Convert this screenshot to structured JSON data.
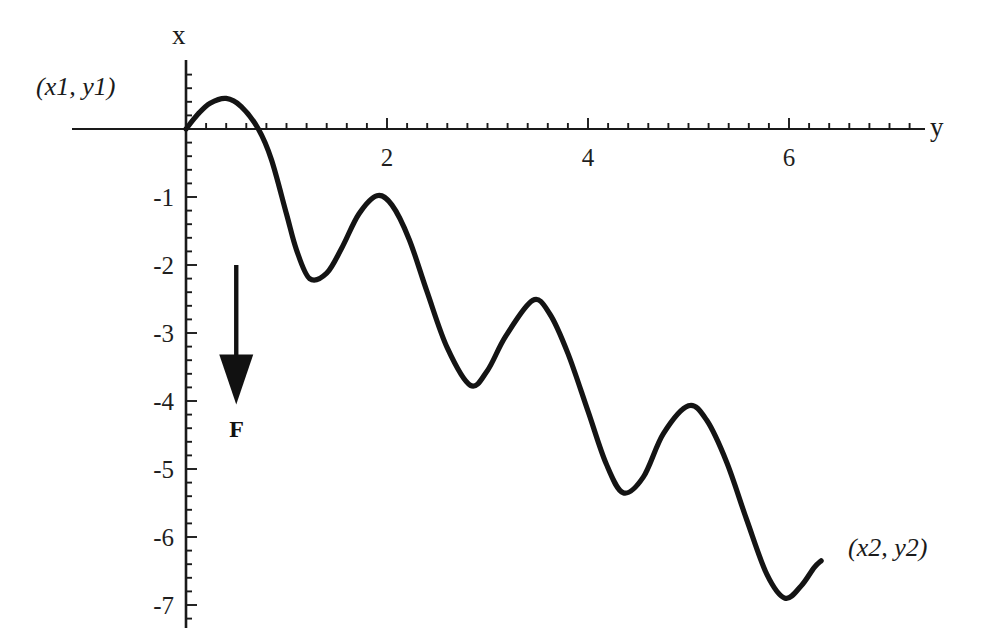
{
  "figure": {
    "background_color": "#ffffff",
    "ink_color": "#1a1a1a",
    "curve_color": "#141414"
  },
  "axes": {
    "vertical_axis_label": "x",
    "horizontal_axis_label": "y",
    "x_ticks": [
      {
        "value": 2,
        "label": "2"
      },
      {
        "value": 4,
        "label": "4"
      },
      {
        "value": 6,
        "label": "6"
      }
    ],
    "y_ticks": [
      {
        "value": -1,
        "label": "-1"
      },
      {
        "value": -2,
        "label": "-2"
      },
      {
        "value": -3,
        "label": "-3"
      },
      {
        "value": -4,
        "label": "-4"
      },
      {
        "value": -5,
        "label": "-5"
      },
      {
        "value": -6,
        "label": "-6"
      },
      {
        "value": -7,
        "label": "-7"
      }
    ]
  },
  "annotations": {
    "start_point_label": "(x1, y1)",
    "end_point_label": "(x2, y2)",
    "force_label": "F",
    "force_arrow_direction": "down"
  },
  "chart_data": {
    "type": "line",
    "title": "",
    "xlabel": "y",
    "ylabel": "x",
    "xlim": [
      -0.15,
      7.35
    ],
    "ylim": [
      -7.5,
      0.85
    ],
    "grid": false,
    "legend": null,
    "x_major_ticks": [
      2,
      4,
      6
    ],
    "y_major_ticks": [
      -1,
      -2,
      -3,
      -4,
      -5,
      -6,
      -7
    ],
    "x_minor_tick_step": 0.2,
    "y_minor_tick_step": 0.2,
    "series": [
      {
        "name": "damped-oscillation",
        "description": "Brachistochrone-like damped oscillating descent from (x1,y1) to (x2,y2)",
        "points": [
          [
            0.0,
            0.0
          ],
          [
            0.12,
            0.22
          ],
          [
            0.24,
            0.38
          ],
          [
            0.4,
            0.45
          ],
          [
            0.55,
            0.33
          ],
          [
            0.72,
            0.0
          ],
          [
            0.85,
            -0.45
          ],
          [
            1.0,
            -1.25
          ],
          [
            1.1,
            -1.78
          ],
          [
            1.23,
            -2.2
          ],
          [
            1.4,
            -2.12
          ],
          [
            1.55,
            -1.75
          ],
          [
            1.72,
            -1.25
          ],
          [
            1.9,
            -0.98
          ],
          [
            2.05,
            -1.12
          ],
          [
            2.22,
            -1.62
          ],
          [
            2.4,
            -2.4
          ],
          [
            2.6,
            -3.22
          ],
          [
            2.83,
            -3.77
          ],
          [
            3.0,
            -3.55
          ],
          [
            3.18,
            -3.05
          ],
          [
            3.45,
            -2.52
          ],
          [
            3.62,
            -2.72
          ],
          [
            3.8,
            -3.3
          ],
          [
            4.0,
            -4.15
          ],
          [
            4.18,
            -4.92
          ],
          [
            4.35,
            -5.35
          ],
          [
            4.55,
            -5.12
          ],
          [
            4.75,
            -4.48
          ],
          [
            5.0,
            -4.07
          ],
          [
            5.18,
            -4.28
          ],
          [
            5.38,
            -4.9
          ],
          [
            5.58,
            -5.75
          ],
          [
            5.78,
            -6.55
          ],
          [
            5.96,
            -6.9
          ],
          [
            6.12,
            -6.72
          ],
          [
            6.25,
            -6.45
          ],
          [
            6.32,
            -6.35
          ]
        ]
      }
    ],
    "markers": [
      {
        "name": "start",
        "x": 0.0,
        "y": 0.0,
        "label": "(x1, y1)"
      },
      {
        "name": "end",
        "x": 6.32,
        "y": -6.35,
        "label": "(x2, y2)"
      }
    ],
    "arrow_annotation": {
      "label": "F",
      "x": 0.5,
      "y_from": -2.0,
      "y_to": -4.05
    }
  }
}
